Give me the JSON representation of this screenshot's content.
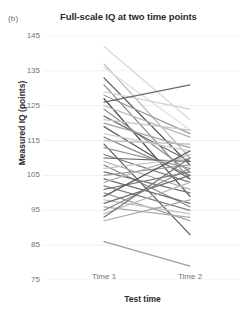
{
  "figure": {
    "panel_label": "(b)",
    "title": "Full-scale IQ at two time points",
    "background_color": "#ffffff",
    "gridline_color": "#f0f0f0",
    "line_color_range": [
      "#c9c9c9",
      "#4a4a4a"
    ]
  },
  "axes": {
    "ylabel": "Measured IQ (points)",
    "xlabel": "Test time",
    "yticks": [
      145,
      135,
      125,
      115,
      105,
      95,
      85,
      75
    ],
    "xticks": [
      "Time 1",
      "Time 2"
    ]
  },
  "chart_data": {
    "type": "line",
    "title": "Full-scale IQ at two time points",
    "subtitle": "(b)",
    "xlabel": "Test time",
    "ylabel": "Measured IQ (points)",
    "categories": [
      "Time 1",
      "Time 2"
    ],
    "x": [
      1,
      2
    ],
    "ylim": [
      75,
      145
    ],
    "yticks": [
      75,
      85,
      95,
      105,
      115,
      125,
      135,
      145
    ],
    "grid": "horizontal",
    "legend": "none",
    "series_note": "Paired individual trajectories (spaghetti plot); each line is one participant, shaded light-to-dark grey.",
    "series": [
      {
        "name": "p01",
        "values": [
          142,
          121
        ],
        "shade": "#d8d8d8"
      },
      {
        "name": "p02",
        "values": [
          137,
          110
        ],
        "shade": "#bdbdbd"
      },
      {
        "name": "p03",
        "values": [
          136,
          118
        ],
        "shade": "#e0e0e0"
      },
      {
        "name": "p04",
        "values": [
          133,
          108
        ],
        "shade": "#555555"
      },
      {
        "name": "p05",
        "values": [
          131,
          104
        ],
        "shade": "#8a8a8a"
      },
      {
        "name": "p06",
        "values": [
          129,
          124
        ],
        "shade": "#d2d2d2"
      },
      {
        "name": "p07",
        "values": [
          128,
          117
        ],
        "shade": "#9a9a9a"
      },
      {
        "name": "p08",
        "values": [
          127,
          99
        ],
        "shade": "#4f4f4f"
      },
      {
        "name": "p09",
        "values": [
          126,
          131
        ],
        "shade": "#6a6a6a"
      },
      {
        "name": "p10",
        "values": [
          125,
          116
        ],
        "shade": "#b5b5b5"
      },
      {
        "name": "p11",
        "values": [
          124,
          106
        ],
        "shade": "#8f8f8f"
      },
      {
        "name": "p12",
        "values": [
          122,
          109
        ],
        "shade": "#707070"
      },
      {
        "name": "p13",
        "values": [
          121,
          118
        ],
        "shade": "#c6c6c6"
      },
      {
        "name": "p14",
        "values": [
          120,
          113
        ],
        "shade": "#a3a3a3"
      },
      {
        "name": "p15",
        "values": [
          119,
          104
        ],
        "shade": "#636363"
      },
      {
        "name": "p16",
        "values": [
          117,
          112
        ],
        "shade": "#cfcfcf"
      },
      {
        "name": "p17",
        "values": [
          116,
          105
        ],
        "shade": "#8d8d8d"
      },
      {
        "name": "p18",
        "values": [
          115,
          114
        ],
        "shade": "#bbbbbb"
      },
      {
        "name": "p19",
        "values": [
          114,
          88
        ],
        "shade": "#5c5c5c"
      },
      {
        "name": "p20",
        "values": [
          113,
          107
        ],
        "shade": "#989898"
      },
      {
        "name": "p21",
        "values": [
          111,
          103
        ],
        "shade": "#7b7b7b"
      },
      {
        "name": "p22",
        "values": [
          110,
          109
        ],
        "shade": "#666666"
      },
      {
        "name": "p23",
        "values": [
          109,
          101
        ],
        "shade": "#adadad"
      },
      {
        "name": "p24",
        "values": [
          108,
          96
        ],
        "shade": "#858585"
      },
      {
        "name": "p25",
        "values": [
          107,
          110
        ],
        "shade": "#c2c2c2"
      },
      {
        "name": "p26",
        "values": [
          106,
          100
        ],
        "shade": "#747474"
      },
      {
        "name": "p27",
        "values": [
          105,
          108
        ],
        "shade": "#9e9e9e"
      },
      {
        "name": "p28",
        "values": [
          104,
          97
        ],
        "shade": "#6f6f6f"
      },
      {
        "name": "p29",
        "values": [
          103,
          111
        ],
        "shade": "#b0b0b0"
      },
      {
        "name": "p30",
        "values": [
          102,
          95
        ],
        "shade": "#828282"
      },
      {
        "name": "p31",
        "values": [
          101,
          106
        ],
        "shade": "#7e7e7e"
      },
      {
        "name": "p32",
        "values": [
          100,
          92
        ],
        "shade": "#9c9c9c"
      },
      {
        "name": "p33",
        "values": [
          99,
          112
        ],
        "shade": "#595959"
      },
      {
        "name": "p34",
        "values": [
          98,
          94
        ],
        "shade": "#c0c0c0"
      },
      {
        "name": "p35",
        "values": [
          97,
          105
        ],
        "shade": "#6d6d6d"
      },
      {
        "name": "p36",
        "values": [
          96,
          93
        ],
        "shade": "#aaaaaa"
      },
      {
        "name": "p37",
        "values": [
          95,
          107
        ],
        "shade": "#868686"
      },
      {
        "name": "p38",
        "values": [
          94,
          103
        ],
        "shade": "#b8b8b8"
      },
      {
        "name": "p39",
        "values": [
          93,
          110
        ],
        "shade": "#767676"
      },
      {
        "name": "p40",
        "values": [
          92,
          98
        ],
        "shade": "#a6a6a6"
      },
      {
        "name": "p41",
        "values": [
          86,
          79
        ],
        "shade": "#9f9f9f"
      }
    ]
  }
}
